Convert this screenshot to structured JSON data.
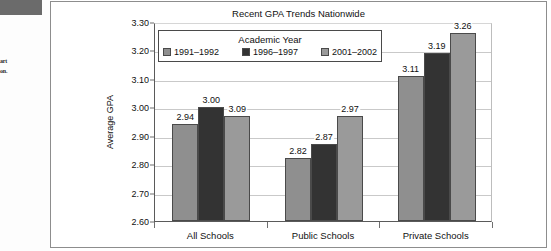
{
  "page_artifacts": {
    "margin_block_name": "scan-artifact-block",
    "text_fragments": [
      "",
      "art",
      "on."
    ]
  },
  "chart_data": {
    "type": "bar",
    "title": "Recent GPA Trends Nationwide",
    "xlabel": "",
    "ylabel": "Average GPA",
    "categories": [
      "All Schools",
      "Public Schools",
      "Private Schools"
    ],
    "series": [
      {
        "name": "1991–1992",
        "color": "#8f8f8f",
        "values": [
          2.94,
          2.82,
          3.11
        ]
      },
      {
        "name": "1996–1997",
        "color": "#333333",
        "values": [
          3.0,
          2.87,
          3.19
        ]
      },
      {
        "name": "2001–2002",
        "color": "#9a9a9a",
        "values": [
          2.97,
          2.97,
          3.26
        ]
      }
    ],
    "ylim": [
      2.6,
      3.3
    ],
    "ytick_labels": [
      "3.30",
      "3.20",
      "3.10",
      "3.00",
      "2.90",
      "2.80",
      "2.70",
      "2.60"
    ],
    "ytick_values": [
      3.3,
      3.2,
      3.1,
      3.0,
      2.9,
      2.8,
      2.7,
      2.6
    ],
    "data_labels": [
      [
        "2.94",
        "3.00",
        "3.09"
      ],
      [
        "2.82",
        "2.87",
        "2.97"
      ],
      [
        "3.11",
        "3.19",
        "3.26"
      ]
    ],
    "grid": true,
    "legend": {
      "title": "Academic Year",
      "position": "upper-left-inside",
      "entries": [
        "1991–1992",
        "1996–1997",
        "2001–2002"
      ]
    }
  }
}
